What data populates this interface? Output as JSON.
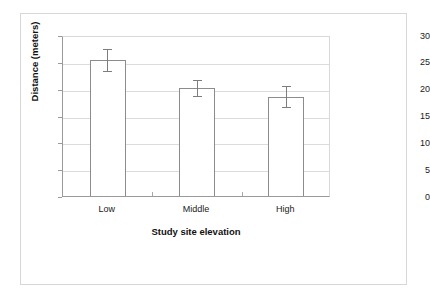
{
  "chart_data": {
    "type": "bar",
    "title": "",
    "categories": [
      "Low",
      "Middle",
      "High"
    ],
    "values": [
      25.3,
      20.1,
      18.5
    ],
    "errors": [
      2.0,
      1.5,
      2.0
    ],
    "xlabel": "Study site elevation",
    "ylabel": "Distance (meters)",
    "ylim": [
      0,
      30
    ],
    "yticks": [
      0,
      5,
      10,
      15,
      20,
      25,
      30
    ],
    "ytick_labels": [
      "0",
      "5",
      "10",
      "15",
      "20",
      "25",
      "30"
    ],
    "grid": true,
    "legend": false,
    "error_bar_style": "capped",
    "bar_fill": "#ffffff",
    "bar_edge": "#8c8c8c",
    "grid_color": "#dcdcdc",
    "axis_color": "#9a9a9a"
  }
}
